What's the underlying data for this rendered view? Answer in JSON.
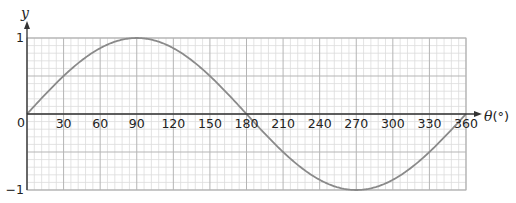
{
  "chart_data": {
    "type": "line",
    "title": "",
    "function": "y = sin(θ)",
    "xlabel": "θ(°)",
    "xlabel_symbol": "θ",
    "xlabel_unit": "(°)",
    "ylabel": "y",
    "xlim": [
      0,
      360
    ],
    "ylim": [
      -1,
      1
    ],
    "x_ticks": [
      0,
      30,
      60,
      90,
      120,
      150,
      180,
      210,
      240,
      270,
      300,
      330,
      360
    ],
    "x_tick_labels": [
      "0",
      "30",
      "60",
      "90",
      "120",
      "150",
      "180",
      "210",
      "240",
      "270",
      "300",
      "330",
      "360"
    ],
    "y_ticks": [
      1,
      0,
      -1
    ],
    "y_tick_labels": [
      "1",
      "0",
      "−1"
    ],
    "grid": true,
    "grid_major_x_step": 30,
    "grid_minor_x_step": 6,
    "grid_major_y_step": 0.5,
    "grid_minor_y_step": 0.1,
    "legend": null,
    "series": [
      {
        "name": "sin θ",
        "x": [
          0,
          30,
          60,
          90,
          120,
          150,
          180,
          210,
          240,
          270,
          300,
          330,
          360
        ],
        "values": [
          0,
          0.5,
          0.87,
          1,
          0.87,
          0.5,
          0,
          -0.5,
          -0.87,
          -1,
          -0.87,
          -0.5,
          0
        ]
      }
    ],
    "colors": {
      "curve": "#8a8a8a",
      "axes": "#333333",
      "grid_major": "#b5b5b5",
      "grid_minor": "#dcdcdc"
    }
  }
}
